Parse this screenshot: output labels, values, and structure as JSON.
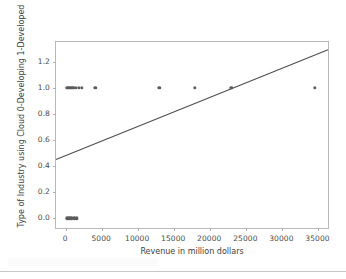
{
  "chart_data": {
    "type": "scatter",
    "title": "",
    "xlabel": "Revenue in million dollars",
    "ylabel": "Type of Industry using Cloud 0-Developing 1-Developed",
    "xlim": [
      -1400,
      36600
    ],
    "ylim": [
      -0.09,
      1.35
    ],
    "xticks": [
      0,
      5000,
      10000,
      15000,
      20000,
      25000,
      30000,
      35000
    ],
    "xticklabels": [
      "0",
      "5000",
      "10000",
      "15000",
      "20000",
      "25000",
      "30000",
      "35000"
    ],
    "yticks": [
      0.0,
      0.2,
      0.4,
      0.6,
      0.8,
      1.0,
      1.2
    ],
    "yticklabels": [
      "0.0",
      "0.2",
      "0.4",
      "0.6",
      "0.8",
      "1.0",
      "1.2"
    ],
    "grid": false,
    "legend": null,
    "marker_color": "#5c5c5c",
    "line_color": "#4d4d4d",
    "axes_color": "#b9b9b9",
    "background": "#ffffff",
    "series": [
      {
        "name": "Industry observations",
        "type": "scatter",
        "points": [
          {
            "x": 150,
            "y": 1.0
          },
          {
            "x": 420,
            "y": 1.0
          },
          {
            "x": 700,
            "y": 1.0
          },
          {
            "x": 1000,
            "y": 1.0
          },
          {
            "x": 1350,
            "y": 1.0
          },
          {
            "x": 1750,
            "y": 1.0
          },
          {
            "x": 2150,
            "y": 1.0
          },
          {
            "x": 4050,
            "y": 1.0
          },
          {
            "x": 12900,
            "y": 1.0
          },
          {
            "x": 17850,
            "y": 1.0
          },
          {
            "x": 22900,
            "y": 1.0
          },
          {
            "x": 34500,
            "y": 1.0
          },
          {
            "x": 150,
            "y": 0.0
          },
          {
            "x": 420,
            "y": 0.0
          },
          {
            "x": 700,
            "y": 0.0
          },
          {
            "x": 1150,
            "y": 0.0
          },
          {
            "x": 1500,
            "y": 0.0
          }
        ]
      },
      {
        "name": "Regression line",
        "type": "line",
        "points": [
          {
            "x": -1400,
            "y": 0.44
          },
          {
            "x": 36600,
            "y": 1.29
          }
        ]
      }
    ]
  }
}
